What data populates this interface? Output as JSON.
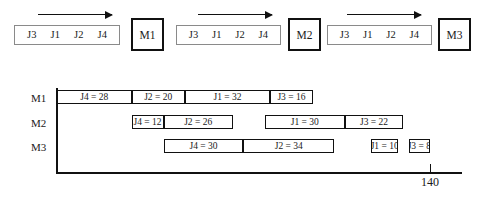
{
  "figure": {
    "title": "",
    "axis_max_label": "140"
  },
  "flow": {
    "arrow_icon": "arrow-right-icon",
    "groups": [
      {
        "id": "group-m1",
        "jobs": [
          "J3",
          "J1",
          "J2",
          "J4"
        ],
        "machine": "M1",
        "queue_left": 14,
        "queue_width": 106,
        "arrow_left": 38,
        "arrow_width": 74,
        "machine_left": 131
      },
      {
        "id": "group-m2",
        "jobs": [
          "J3",
          "J1",
          "J2",
          "J4"
        ],
        "machine": "M2",
        "queue_left": 176,
        "queue_width": 105,
        "arrow_left": 198,
        "arrow_width": 74,
        "machine_left": 288
      },
      {
        "id": "group-m3",
        "jobs": [
          "J3",
          "J1",
          "J2",
          "J4"
        ],
        "machine": "M3",
        "queue_left": 327,
        "queue_width": 105,
        "arrow_left": 347,
        "arrow_width": 74,
        "machine_left": 438
      }
    ]
  },
  "chart_data": {
    "type": "bar",
    "chart_kind": "gantt",
    "title": "",
    "xlabel": "",
    "ylabel": "",
    "xlim": [
      0,
      140
    ],
    "grid": false,
    "legend": "none",
    "x_ticks": [
      140
    ],
    "x_tick_labels": [
      "140"
    ],
    "machines": [
      "M1",
      "M2",
      "M3"
    ],
    "series": [
      {
        "name": "M1",
        "row_top": 5,
        "tasks": [
          {
            "label": "J4 = 28",
            "job": "J4",
            "duration": 28,
            "start": 0,
            "end": 28
          },
          {
            "label": "J2 = 20",
            "job": "J2",
            "duration": 20,
            "start": 28,
            "end": 48
          },
          {
            "label": "J1 = 32",
            "job": "J1",
            "duration": 32,
            "start": 48,
            "end": 80
          },
          {
            "label": "J3 = 16",
            "job": "J3",
            "duration": 16,
            "start": 80,
            "end": 96
          }
        ]
      },
      {
        "name": "M2",
        "row_top": 30,
        "tasks": [
          {
            "label": "J4 = 12",
            "job": "J4",
            "duration": 12,
            "start": 28,
            "end": 40
          },
          {
            "label": "J2 = 26",
            "job": "J2",
            "duration": 26,
            "start": 40,
            "end": 66
          },
          {
            "label": "J1 = 30",
            "job": "J1",
            "duration": 30,
            "start": 78,
            "end": 108
          },
          {
            "label": "J3 = 22",
            "job": "J3",
            "duration": 22,
            "start": 108,
            "end": 130
          }
        ]
      },
      {
        "name": "M3",
        "row_top": 54,
        "tasks": [
          {
            "label": "J4 = 30",
            "job": "J4",
            "duration": 30,
            "start": 40,
            "end": 70
          },
          {
            "label": "J2 = 34",
            "job": "J2",
            "duration": 34,
            "start": 70,
            "end": 104
          },
          {
            "label": "J1 = 10",
            "job": "J1",
            "duration": 10,
            "start": 118,
            "end": 128
          },
          {
            "label": "J3 = 8",
            "job": "J3",
            "duration": 8,
            "start": 132,
            "end": 140
          }
        ]
      }
    ]
  },
  "geometry": {
    "origin_x": 57,
    "px_per_unit": 2.664,
    "axis_end_x": 462
  }
}
